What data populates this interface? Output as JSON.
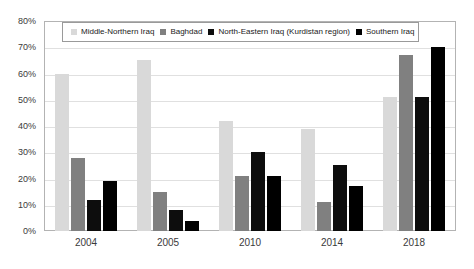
{
  "chart_data": {
    "type": "bar",
    "title": "",
    "xlabel": "",
    "ylabel": "",
    "categories": [
      "2004",
      "2005",
      "2010",
      "2014",
      "2018"
    ],
    "ylim": [
      0,
      80
    ],
    "ytick_labels": [
      "0%",
      "10%",
      "20%",
      "30%",
      "40%",
      "50%",
      "60%",
      "70%",
      "80%"
    ],
    "ytick_values": [
      0,
      10,
      20,
      30,
      40,
      50,
      60,
      70,
      80
    ],
    "grid": true,
    "legend_position": "top-inside",
    "series": [
      {
        "name": "Middle-Northern Iraq",
        "color": "#d9d9d9",
        "values": [
          60,
          65,
          42,
          39,
          51
        ]
      },
      {
        "name": "Baghdad",
        "color": "#808080",
        "values": [
          28,
          15,
          21,
          11,
          67
        ]
      },
      {
        "name": "North-Eastern Iraq (Kurdistan region)",
        "color": "#0d0d0d",
        "values": [
          12,
          8,
          30,
          25,
          51
        ]
      },
      {
        "name": "Southern Iraq",
        "color": "#000000",
        "values": [
          19,
          4,
          21,
          17,
          70
        ]
      }
    ]
  }
}
